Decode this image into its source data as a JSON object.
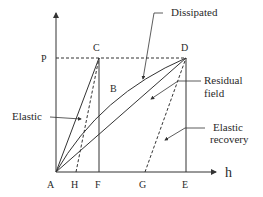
{
  "diagram": {
    "type": "load-displacement hysteresis diagram",
    "axes": {
      "x_label": "h",
      "y_label": ""
    },
    "points": {
      "A": "A",
      "H": "H",
      "F": "F",
      "G": "G",
      "E": "E",
      "P": "P",
      "C": "C",
      "D": "D",
      "B": "B"
    },
    "annotations": {
      "dissipated": "Dissipated",
      "residual_1": "Residual",
      "residual_2": "field",
      "elastic": "Elastic",
      "elastic_recovery_1": "Elastic",
      "elastic_recovery_2": "recovery"
    },
    "colors": {
      "line": "#333333",
      "text": "#2a2a2a",
      "background": "#ffffff"
    }
  }
}
